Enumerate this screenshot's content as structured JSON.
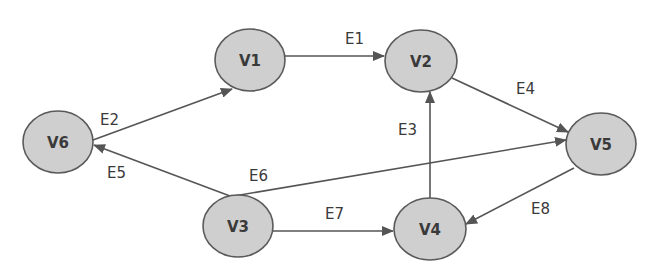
{
  "diagram": {
    "type": "directed-graph",
    "colors": {
      "node_fill": "#cfcfcf",
      "node_stroke": "#5a5a5a",
      "edge": "#555555",
      "text": "#3a3a3a"
    },
    "nodes": [
      {
        "id": "V1",
        "label": "V1",
        "cx": 250,
        "cy": 60
      },
      {
        "id": "V2",
        "label": "V2",
        "cx": 421,
        "cy": 61
      },
      {
        "id": "V3",
        "label": "V3",
        "cx": 238,
        "cy": 226
      },
      {
        "id": "V4",
        "label": "V4",
        "cx": 430,
        "cy": 229
      },
      {
        "id": "V5",
        "label": "V5",
        "cx": 601,
        "cy": 144
      },
      {
        "id": "V6",
        "label": "V6",
        "cx": 58,
        "cy": 142
      }
    ],
    "edges": [
      {
        "id": "E1",
        "label": "E1",
        "from": "V1",
        "to": "V2"
      },
      {
        "id": "E2",
        "label": "E2",
        "from": "V6",
        "to": "V1"
      },
      {
        "id": "E3",
        "label": "E3",
        "from": "V4",
        "to": "V2"
      },
      {
        "id": "E4",
        "label": "E4",
        "from": "V2",
        "to": "V5"
      },
      {
        "id": "E5",
        "label": "E5",
        "from": "V3",
        "to": "V6"
      },
      {
        "id": "E6",
        "label": "E6",
        "from": "V3",
        "to": "V5"
      },
      {
        "id": "E7",
        "label": "E7",
        "from": "V3",
        "to": "V4"
      },
      {
        "id": "E8",
        "label": "E8",
        "from": "V5",
        "to": "V4"
      }
    ]
  }
}
